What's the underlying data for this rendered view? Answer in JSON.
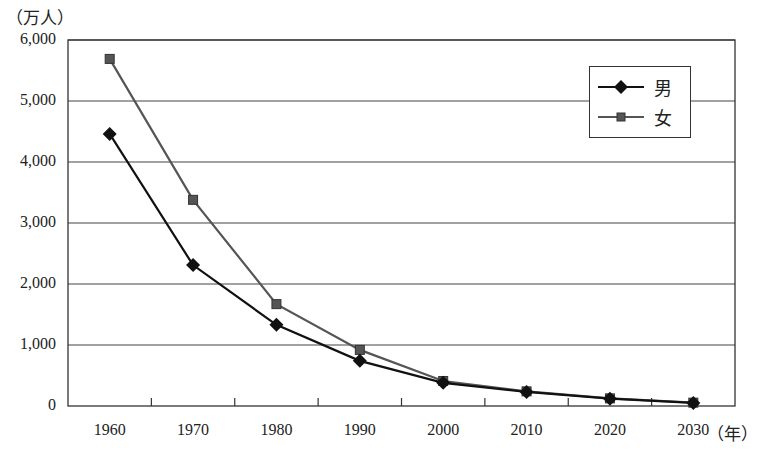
{
  "chart_data": {
    "type": "line",
    "title": "",
    "xlabel": "（年）",
    "ylabel": "（万人）",
    "categories": [
      "1960",
      "1970",
      "1980",
      "1990",
      "2000",
      "2010",
      "2020",
      "2030"
    ],
    "y_ticks": [
      "0",
      "1,000",
      "2,000",
      "3,000",
      "4,000",
      "5,000",
      "6,000"
    ],
    "ylim": [
      0,
      6000
    ],
    "grid": "horizontal",
    "legend_position": "upper right (inside)",
    "series": [
      {
        "name": "男",
        "marker": "diamond",
        "color": "#111111",
        "values": [
          4460,
          2310,
          1330,
          740,
          380,
          230,
          120,
          50
        ]
      },
      {
        "name": "女",
        "marker": "square",
        "color": "#555555",
        "values": [
          5690,
          3380,
          1670,
          920,
          410,
          240,
          125,
          55
        ]
      }
    ]
  },
  "labels": {
    "y_unit": "（万人）",
    "x_unit": "（年）"
  }
}
